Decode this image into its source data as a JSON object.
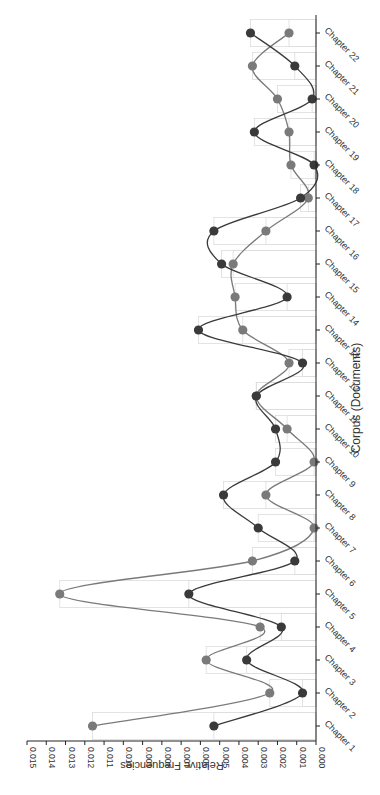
{
  "chart_data": {
    "type": "line",
    "orientation": "rotated-90",
    "title": "",
    "xlabel": "Corpus (Documents)",
    "ylabel": "Relative Frequencies",
    "ylim": [
      0,
      0.015
    ],
    "yticks": [
      "0.000",
      "0.001",
      "0.002",
      "0.003",
      "0.004",
      "0.005",
      "0.006",
      "0.007",
      "0.008",
      "0.009",
      "0.010",
      "0.011",
      "0.012",
      "0.013",
      "0.014",
      "0.015"
    ],
    "categories": [
      "Chapter 1",
      "Chapter 2",
      "Chapter 3",
      "Chapter 4",
      "Chapter 5",
      "Chapter 6",
      "Chapter 7",
      "Chapter 8",
      "Chapter 9",
      "Chapter 10",
      "Chapter 11",
      "Chapter 12",
      "Chapter 13",
      "Chapter 14",
      "Chapter 15",
      "Chapter 16",
      "Chapter 17",
      "Chapter 18",
      "Chapter 19",
      "Chapter 20",
      "Chapter 21",
      "Chapter 22"
    ],
    "series": [
      {
        "name": "Series A (light)",
        "color": "#7a7a7a",
        "values": [
          0.0116,
          0.0024,
          0.0057,
          0.0029,
          0.0133,
          0.0033,
          0.0001,
          0.0026,
          0.0001,
          0.0015,
          0.0031,
          0.0014,
          0.0038,
          0.0042,
          0.0043,
          0.0026,
          0.0004,
          0.0013,
          0.0014,
          0.002,
          0.0033,
          0.0014
        ]
      },
      {
        "name": "Series B (dark)",
        "color": "#3a3a3a",
        "values": [
          0.0053,
          0.0007,
          0.0036,
          0.0018,
          0.0066,
          0.0011,
          0.003,
          0.0048,
          0.0021,
          0.0021,
          0.0031,
          0.0007,
          0.0061,
          0.0015,
          0.0049,
          0.0053,
          0.0008,
          0.0001,
          0.0032,
          0.0002,
          0.0011,
          0.0034
        ]
      }
    ],
    "grid": false,
    "legend": "none",
    "background_bars": true
  },
  "labels": {
    "x_axis_title": "Corpus (Documents)",
    "y_axis_title": "Relative Frequencies"
  }
}
